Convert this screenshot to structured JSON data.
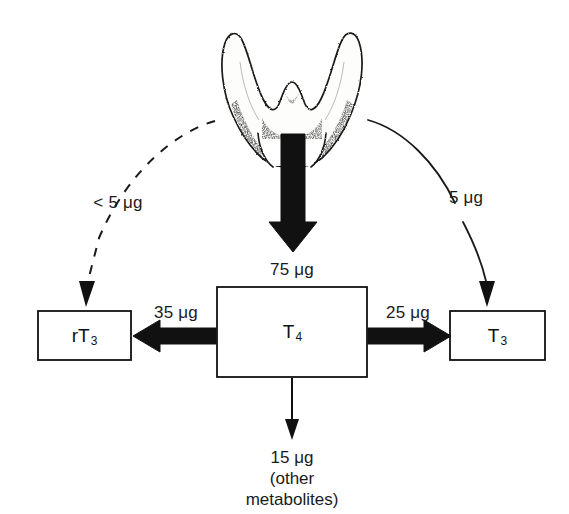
{
  "figure": {
    "type": "flow-diagram",
    "units": "μg per day"
  },
  "source": {
    "name": "thyroid-gland",
    "label": ""
  },
  "nodes": [
    {
      "id": "rT3",
      "label": "rT",
      "sub": "3",
      "x": 84,
      "y": 336
    },
    {
      "id": "T4",
      "label": "T",
      "sub": "4",
      "x": 292,
      "y": 332
    },
    {
      "id": "T3",
      "label": "T",
      "sub": "3",
      "x": 497,
      "y": 336
    }
  ],
  "flows": [
    {
      "id": "thyroid-to-rT3",
      "amount": "< 5 μg",
      "style": "dashed-curve",
      "label_x": 118,
      "label_y": 203
    },
    {
      "id": "thyroid-to-T4",
      "amount": "75 μg",
      "style": "thick-straight",
      "label_x": 292,
      "label_y": 270
    },
    {
      "id": "thyroid-to-T3",
      "amount": "5 μg",
      "style": "solid-curve",
      "label_x": 466,
      "label_y": 198
    },
    {
      "id": "T4-to-rT3",
      "amount": "35 μg",
      "style": "thick-straight",
      "label_x": 176,
      "label_y": 313
    },
    {
      "id": "T4-to-T3",
      "amount": "25 μg",
      "style": "thick-straight",
      "label_x": 408,
      "label_y": 313
    },
    {
      "id": "T4-to-metabolites",
      "amount": "15 μg",
      "style": "thin-straight",
      "label_x": 292,
      "label_y": 455
    }
  ],
  "metabolites": {
    "amount": "15 μg",
    "line2": "(other",
    "line3": "metabolites)"
  },
  "colors": {
    "ink": "#111111",
    "background": "#ffffff",
    "gland_fill": "#fbfbfa",
    "gland_stroke": "#1a1a1a"
  }
}
